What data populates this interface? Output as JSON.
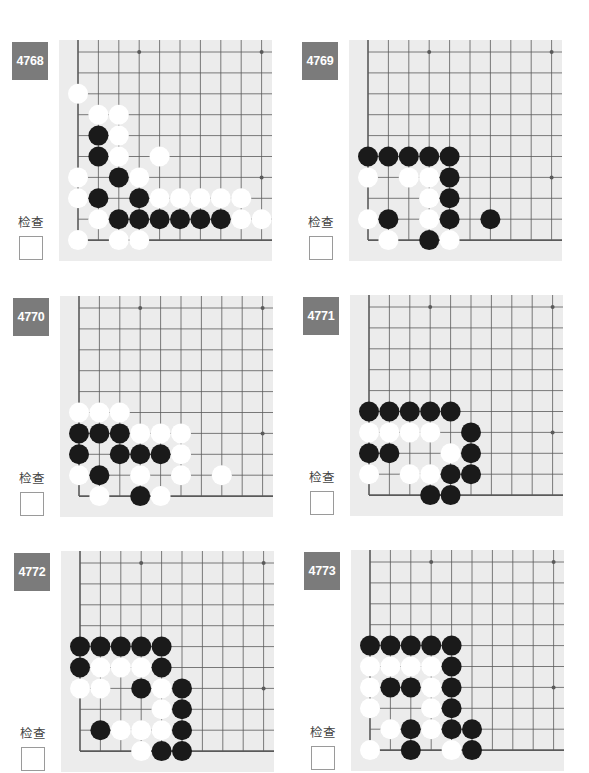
{
  "check_label": "检查",
  "colors": {
    "label_bg": "#7b7b7b",
    "board_bg": "#ececec",
    "grid_line": "#5a5a5a",
    "black_stone": "#1a1a1a",
    "white_stone": "#ffffff"
  },
  "grid": {
    "columns": 10,
    "rows": 10,
    "open_edges": [
      "top",
      "right"
    ],
    "closed_edges": [
      "left",
      "bottom"
    ],
    "star_points": [
      [
        3,
        0
      ],
      [
        9,
        0
      ],
      [
        9,
        6
      ]
    ]
  },
  "problems": [
    {
      "number": "4768",
      "stones": {
        "black": [
          [
            1,
            4
          ],
          [
            1,
            5
          ],
          [
            2,
            6
          ],
          [
            1,
            7
          ],
          [
            3,
            7
          ],
          [
            2,
            8
          ],
          [
            3,
            8
          ],
          [
            4,
            8
          ],
          [
            5,
            8
          ],
          [
            6,
            8
          ],
          [
            7,
            8
          ]
        ],
        "white": [
          [
            0,
            2
          ],
          [
            1,
            3
          ],
          [
            2,
            3
          ],
          [
            2,
            4
          ],
          [
            2,
            5
          ],
          [
            4,
            5
          ],
          [
            0,
            6
          ],
          [
            3,
            6
          ],
          [
            0,
            7
          ],
          [
            4,
            7
          ],
          [
            5,
            7
          ],
          [
            6,
            7
          ],
          [
            7,
            7
          ],
          [
            8,
            7
          ],
          [
            1,
            8
          ],
          [
            8,
            8
          ],
          [
            9,
            8
          ],
          [
            0,
            9
          ],
          [
            2,
            9
          ],
          [
            3,
            9
          ]
        ]
      }
    },
    {
      "number": "4769",
      "stones": {
        "black": [
          [
            0,
            5
          ],
          [
            1,
            5
          ],
          [
            2,
            5
          ],
          [
            3,
            5
          ],
          [
            4,
            5
          ],
          [
            4,
            6
          ],
          [
            4,
            7
          ],
          [
            1,
            8
          ],
          [
            4,
            8
          ],
          [
            6,
            8
          ],
          [
            3,
            9
          ]
        ],
        "white": [
          [
            0,
            6
          ],
          [
            2,
            6
          ],
          [
            3,
            6
          ],
          [
            3,
            7
          ],
          [
            0,
            8
          ],
          [
            3,
            8
          ],
          [
            1,
            9
          ],
          [
            4,
            9
          ]
        ]
      }
    },
    {
      "number": "4770",
      "stones": {
        "black": [
          [
            0,
            6
          ],
          [
            1,
            6
          ],
          [
            2,
            6
          ],
          [
            0,
            7
          ],
          [
            2,
            7
          ],
          [
            3,
            7
          ],
          [
            4,
            7
          ],
          [
            1,
            8
          ],
          [
            3,
            9
          ]
        ],
        "white": [
          [
            0,
            5
          ],
          [
            1,
            5
          ],
          [
            2,
            5
          ],
          [
            3,
            6
          ],
          [
            4,
            6
          ],
          [
            5,
            6
          ],
          [
            5,
            7
          ],
          [
            0,
            8
          ],
          [
            3,
            8
          ],
          [
            5,
            8
          ],
          [
            7,
            8
          ],
          [
            1,
            9
          ],
          [
            4,
            9
          ]
        ]
      }
    },
    {
      "number": "4771",
      "stones": {
        "black": [
          [
            0,
            5
          ],
          [
            1,
            5
          ],
          [
            2,
            5
          ],
          [
            3,
            5
          ],
          [
            4,
            5
          ],
          [
            5,
            6
          ],
          [
            0,
            7
          ],
          [
            1,
            7
          ],
          [
            5,
            7
          ],
          [
            4,
            8
          ],
          [
            5,
            8
          ],
          [
            3,
            9
          ],
          [
            4,
            9
          ]
        ],
        "white": [
          [
            0,
            6
          ],
          [
            1,
            6
          ],
          [
            2,
            6
          ],
          [
            3,
            6
          ],
          [
            4,
            7
          ],
          [
            0,
            8
          ],
          [
            2,
            8
          ],
          [
            3,
            8
          ]
        ]
      }
    },
    {
      "number": "4772",
      "stones": {
        "black": [
          [
            0,
            4
          ],
          [
            1,
            4
          ],
          [
            2,
            4
          ],
          [
            3,
            4
          ],
          [
            4,
            4
          ],
          [
            0,
            5
          ],
          [
            4,
            5
          ],
          [
            3,
            6
          ],
          [
            5,
            6
          ],
          [
            5,
            7
          ],
          [
            1,
            8
          ],
          [
            5,
            8
          ],
          [
            4,
            9
          ],
          [
            5,
            9
          ]
        ],
        "white": [
          [
            1,
            5
          ],
          [
            2,
            5
          ],
          [
            3,
            5
          ],
          [
            0,
            6
          ],
          [
            1,
            6
          ],
          [
            4,
            6
          ],
          [
            4,
            7
          ],
          [
            2,
            8
          ],
          [
            3,
            8
          ],
          [
            4,
            8
          ],
          [
            3,
            9
          ]
        ]
      }
    },
    {
      "number": "4773",
      "stones": {
        "black": [
          [
            0,
            4
          ],
          [
            1,
            4
          ],
          [
            2,
            4
          ],
          [
            3,
            4
          ],
          [
            4,
            4
          ],
          [
            4,
            5
          ],
          [
            1,
            6
          ],
          [
            2,
            6
          ],
          [
            4,
            6
          ],
          [
            4,
            7
          ],
          [
            2,
            8
          ],
          [
            4,
            8
          ],
          [
            5,
            8
          ],
          [
            2,
            9
          ],
          [
            5,
            9
          ]
        ],
        "white": [
          [
            0,
            5
          ],
          [
            1,
            5
          ],
          [
            2,
            5
          ],
          [
            3,
            5
          ],
          [
            0,
            6
          ],
          [
            3,
            6
          ],
          [
            0,
            7
          ],
          [
            3,
            7
          ],
          [
            1,
            8
          ],
          [
            3,
            8
          ],
          [
            0,
            9
          ],
          [
            4,
            9
          ]
        ]
      }
    }
  ]
}
